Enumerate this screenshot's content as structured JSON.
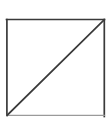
{
  "canvas": {
    "width": 112,
    "height": 122,
    "background_color": "#ffffff"
  },
  "figure": {
    "name": "square-with-diagonal",
    "description": "Square outline divided by a diagonal line into two triangles",
    "shape_type": "square",
    "fill_color": "none",
    "stroke_color": "#3a3a3a",
    "stroke_width": 1.6,
    "square": {
      "x": 6.5,
      "y": 19.5,
      "width": 98,
      "height": 96
    },
    "diagonal": {
      "name": "diagonal-line",
      "from_corner": "bottom-left",
      "to_corner": "top-right",
      "x1": 7,
      "y1": 115,
      "x2": 104,
      "y2": 20,
      "stroke_color": "#3a3a3a",
      "stroke_width": 1.6
    },
    "bottom_edge": {
      "name": "bottom-edge",
      "stroke_color": "#8d8d8d",
      "stroke_width": 1.2,
      "note": "faded"
    },
    "regions": [
      {
        "name": "upper-left-triangle",
        "fill": "none"
      },
      {
        "name": "lower-right-triangle",
        "fill": "none"
      }
    ]
  }
}
